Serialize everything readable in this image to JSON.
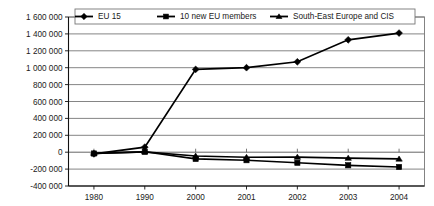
{
  "chart_data": {
    "type": "line",
    "title": "",
    "subtitle": "",
    "xlabel": "",
    "ylabel": "",
    "categories": [
      "1980",
      "1990",
      "2000",
      "2001",
      "2002",
      "2003",
      "2004"
    ],
    "series": [
      {
        "name": "EU 15",
        "marker": "diamond",
        "color": "#000000",
        "values": [
          -20000,
          60000,
          980000,
          1000000,
          1070000,
          1330000,
          1410000
        ]
      },
      {
        "name": "10 new EU members",
        "marker": "square",
        "color": "#000000",
        "values": [
          -15000,
          5000,
          -80000,
          -95000,
          -125000,
          -155000,
          -175000
        ]
      },
      {
        "name": "South-East Europe and CIS",
        "marker": "triangle",
        "color": "#000000",
        "values": [
          -15000,
          5000,
          -45000,
          -60000,
          -58000,
          -70000,
          -80000
        ]
      }
    ],
    "ylim": [
      -400000,
      1600000
    ],
    "ytick_values": [
      1600000,
      1400000,
      1200000,
      1000000,
      800000,
      600000,
      400000,
      200000,
      0,
      -200000,
      -400000
    ],
    "ytick_labels": [
      "1 600 000",
      "1 400 000",
      "1 200 000",
      "1 000 000",
      "800 000",
      "600 000",
      "400 000",
      "200 000",
      "0",
      "-200 000",
      "-400 000"
    ],
    "grid": true,
    "grid_axis": "y",
    "legend_position": "top-inside",
    "annotations": []
  },
  "legend": {
    "entries": [
      {
        "label": "EU 15",
        "marker": "diamond-marker-icon"
      },
      {
        "label": "10 new EU members",
        "marker": "square-marker-icon"
      },
      {
        "label": "South-East Europe and CIS",
        "marker": "triangle-marker-icon"
      }
    ]
  },
  "axes": {
    "y": {
      "ticks": [
        "1 600 000",
        "1 400 000",
        "1 200 000",
        "1 000 000",
        "800 000",
        "600 000",
        "400 000",
        "200 000",
        "0",
        "-200 000",
        "-400 000"
      ]
    },
    "x": {
      "ticks": [
        "1980",
        "1990",
        "2000",
        "2001",
        "2002",
        "2003",
        "2004"
      ]
    }
  },
  "colors": {
    "series": "#000000",
    "grid": "#666666",
    "axis": "#111111",
    "background": "#ffffff"
  }
}
